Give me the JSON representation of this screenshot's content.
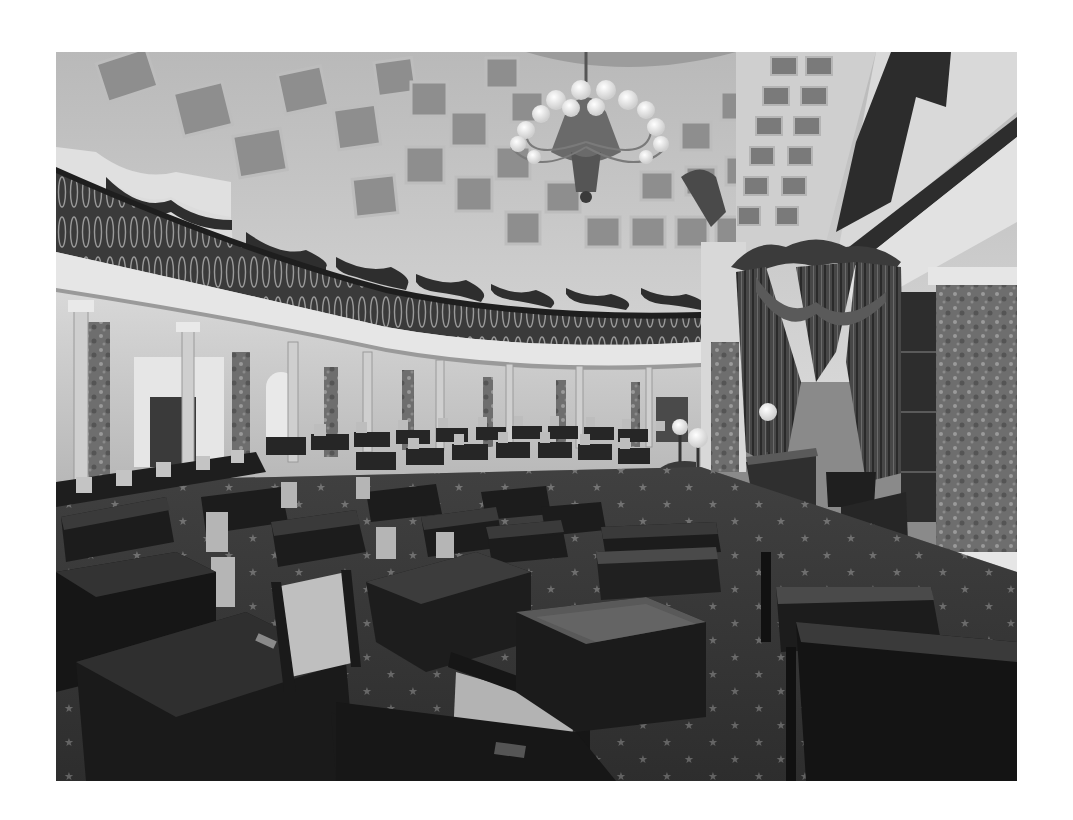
{
  "image": {
    "description": "Black-and-white photograph of a historic semicircular legislative chamber with a coffered domed ceiling, chandelier, curved gallery balcony, colonnade, rows of wooden desks and chairs, and a canopied presiding officer's dais.",
    "palette": {
      "page_background": "#ffffff",
      "ceiling": "#c9c9c9",
      "coffer": "#8e8e8e",
      "gallery_rail": "#2b2b2b",
      "drape": "#2e2e2e",
      "wall": "#d4d4d4",
      "marble_column": "#7a7a7a",
      "desk": "#1c1c1c",
      "desk_top": "#3a3a3a",
      "carpet": "#3c3c3c",
      "chandelier_globe": "#f2f2f2"
    },
    "components": [
      "coffered-dome-ceiling",
      "chandelier",
      "gallery-balcony",
      "gallery-drapes",
      "colonnade",
      "senator-desks",
      "presiding-dais",
      "dais-canopy-curtains",
      "marble-columns",
      "star-carpet",
      "globe-lamps"
    ]
  }
}
